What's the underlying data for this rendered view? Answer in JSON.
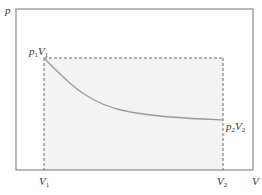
{
  "diagram": {
    "axes": {
      "y_label": "p",
      "x_label": "V"
    },
    "points": {
      "start": {
        "p": "p",
        "p_sub": "1",
        "v": "V",
        "v_sub": "1"
      },
      "end": {
        "p": "p",
        "p_sub": "2",
        "v": "V",
        "v_sub": "2"
      }
    },
    "ticks": {
      "v1": {
        "main": "V",
        "sub": "1"
      },
      "v2": {
        "main": "V",
        "sub": "2"
      }
    },
    "colors": {
      "frame": "#8a8a8a",
      "dashed": "#6a6a6a",
      "fill": "#f3f3f3",
      "curve": "#9a9a9a",
      "text": "#333333"
    }
  }
}
